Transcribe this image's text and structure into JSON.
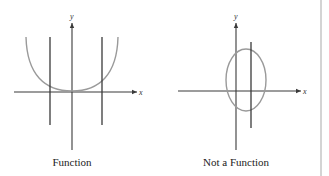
{
  "panels": [
    {
      "caption": "Function",
      "axis_labels": {
        "x": "x",
        "y": "y"
      },
      "curve": "U-shaped curve (parabola-like)",
      "vertical_lines": 2
    },
    {
      "caption": "Not a Function",
      "axis_labels": {
        "x": "x",
        "y": "y"
      },
      "curve": "ellipse",
      "vertical_lines": 1
    }
  ],
  "colors": {
    "axis": "#3a3a3a",
    "curve": "#9a9a9a",
    "divider": "#d4d4d4"
  }
}
